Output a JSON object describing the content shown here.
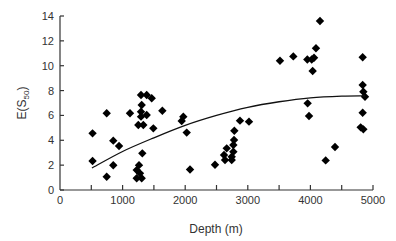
{
  "chart_data": {
    "type": "scatter",
    "title": "",
    "xlabel": "Depth (m)",
    "ylabel": "E(S",
    "ylabel_subscript": "50",
    "ylabel_close": ")",
    "xlim": [
      0,
      5000
    ],
    "ylim": [
      0,
      14
    ],
    "xticks": [
      0,
      1000,
      2000,
      3000,
      4000,
      5000
    ],
    "xticks_minor": [
      500,
      1500,
      2500,
      3500,
      4500
    ],
    "yticks": [
      0,
      2,
      4,
      6,
      8,
      10,
      12,
      14
    ],
    "grid": false,
    "legend": null,
    "marker": "diamond",
    "marker_color": "#000000",
    "series": [
      {
        "name": "samples",
        "points": [
          [
            520,
            4.56
          ],
          [
            520,
            2.33
          ],
          [
            746,
            6.17
          ],
          [
            746,
            1.07
          ],
          [
            851,
            3.97
          ],
          [
            851,
            1.99
          ],
          [
            943,
            3.54
          ],
          [
            1118,
            6.17
          ],
          [
            1294,
            7.64
          ],
          [
            1385,
            7.64
          ],
          [
            1465,
            7.38
          ],
          [
            1305,
            6.84
          ],
          [
            1294,
            6.3
          ],
          [
            1385,
            6.03
          ],
          [
            1294,
            5.9
          ],
          [
            1635,
            6.38
          ],
          [
            1251,
            5.23
          ],
          [
            1331,
            5.23
          ],
          [
            1491,
            4.96
          ],
          [
            1315,
            2.95
          ],
          [
            1262,
            2.0
          ],
          [
            1225,
            1.6
          ],
          [
            1278,
            1.34
          ],
          [
            1225,
            0.94
          ],
          [
            1305,
            0.94
          ],
          [
            1970,
            5.9
          ],
          [
            1944,
            5.55
          ],
          [
            2024,
            4.62
          ],
          [
            2077,
            1.65
          ],
          [
            2476,
            2.03
          ],
          [
            2875,
            5.58
          ],
          [
            3019,
            5.5
          ],
          [
            2785,
            4.77
          ],
          [
            2780,
            4.02
          ],
          [
            2769,
            3.62
          ],
          [
            2663,
            3.35
          ],
          [
            2769,
            3.08
          ],
          [
            2620,
            2.82
          ],
          [
            2743,
            2.68
          ],
          [
            2636,
            2.41
          ],
          [
            2743,
            2.41
          ],
          [
            3514,
            10.4
          ],
          [
            3727,
            10.75
          ],
          [
            3951,
            10.5
          ],
          [
            4021,
            10.5
          ],
          [
            4058,
            10.64
          ],
          [
            4089,
            11.4
          ],
          [
            4153,
            13.6
          ],
          [
            4036,
            9.57
          ],
          [
            3956,
            6.97
          ],
          [
            3978,
            5.95
          ],
          [
            4393,
            3.46
          ],
          [
            4244,
            2.38
          ],
          [
            4835,
            10.68
          ],
          [
            4835,
            8.45
          ],
          [
            4846,
            7.91
          ],
          [
            4872,
            7.5
          ],
          [
            4835,
            6.22
          ],
          [
            4803,
            5.04
          ],
          [
            4846,
            4.88
          ]
        ]
      }
    ],
    "fit_curve": {
      "name": "fitted trend",
      "points": [
        [
          510,
          1.77
        ],
        [
          1000,
          3.1
        ],
        [
          1500,
          4.2
        ],
        [
          2000,
          5.2
        ],
        [
          2500,
          6.0
        ],
        [
          3000,
          6.65
        ],
        [
          3500,
          7.1
        ],
        [
          4000,
          7.42
        ],
        [
          4500,
          7.56
        ],
        [
          4870,
          7.58
        ]
      ]
    }
  }
}
